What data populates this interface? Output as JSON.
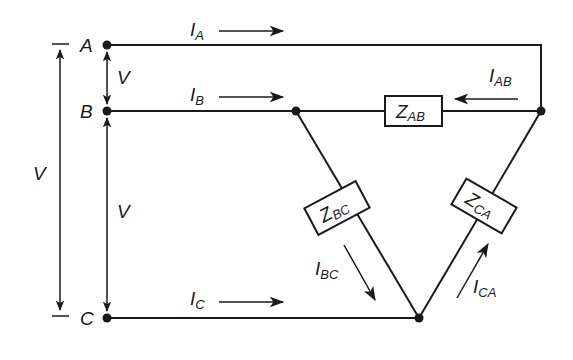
{
  "diagram": {
    "type": "delta-connected three-phase load",
    "nodes": [
      {
        "id": "A",
        "label": "A"
      },
      {
        "id": "B",
        "label": "B"
      },
      {
        "id": "C",
        "label": "C"
      }
    ],
    "line_currents": [
      {
        "id": "IA",
        "main": "I",
        "sub": "A"
      },
      {
        "id": "IB",
        "main": "I",
        "sub": "B"
      },
      {
        "id": "IC",
        "main": "I",
        "sub": "C"
      }
    ],
    "phase_currents": [
      {
        "id": "IAB",
        "main": "I",
        "sub": "AB"
      },
      {
        "id": "IBC",
        "main": "I",
        "sub": "BC"
      },
      {
        "id": "ICA",
        "main": "I",
        "sub": "CA"
      }
    ],
    "impedances": [
      {
        "id": "ZAB",
        "main": "Z",
        "sub": "AB"
      },
      {
        "id": "ZBC",
        "main": "Z",
        "sub": "BC"
      },
      {
        "id": "ZCA",
        "main": "Z",
        "sub": "CA"
      }
    ],
    "voltages": {
      "AB": "V",
      "BC": "V",
      "AC": "V"
    },
    "colors": {
      "ink": "#1a1a1a",
      "background": "#ffffff"
    }
  }
}
